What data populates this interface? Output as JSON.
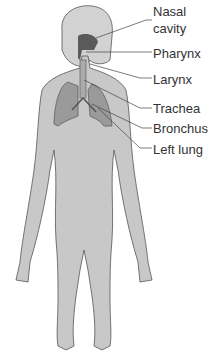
{
  "diagram": {
    "labels": {
      "nasal_line1": "Nasal",
      "nasal_line2": "cavity",
      "pharynx": "Pharynx",
      "larynx": "Larynx",
      "trachea": "Trachea",
      "bronchus": "Bronchus",
      "left_lung": "Left lung"
    },
    "colors": {
      "body": "#c8c8c8",
      "outline": "#555555",
      "lung": "#9a9a9a",
      "airway": "#5a5a5a",
      "leader": "#444444",
      "text": "#333333"
    }
  }
}
